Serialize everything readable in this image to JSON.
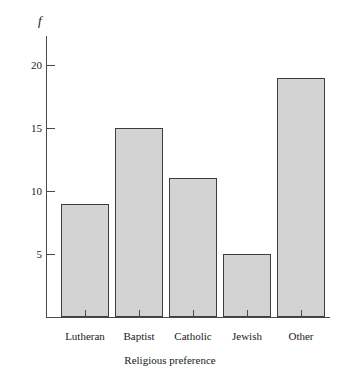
{
  "chart_data": {
    "type": "bar",
    "title": "",
    "subtitle": "",
    "xlabel": "Religious preference",
    "ylabel": "f",
    "categories": [
      "Lutheran",
      "Baptist",
      "Catholic",
      "Jewish",
      "Other"
    ],
    "values": [
      9,
      15,
      11,
      5,
      19
    ],
    "series": [
      {
        "name": "f",
        "values": [
          9,
          15,
          11,
          5,
          19
        ]
      }
    ],
    "ylim": [
      0,
      22
    ],
    "yticks": [
      5,
      10,
      15,
      20
    ],
    "ytick_labels": [
      "5",
      "10",
      "15",
      "20"
    ],
    "grid": false,
    "legend": false,
    "legend_position": "none",
    "bar_fill_color": "#d3d3d3",
    "bar_border_color": "#3d3d3d",
    "axis_color": "#4a4a4a",
    "background_color": "#ffffff"
  },
  "axes": {
    "y_axis_label": "f",
    "x_axis_label": "Religious preference",
    "y_tick_labels": [
      "20",
      "15",
      "10",
      "5"
    ]
  },
  "bars": [
    {
      "label": "Lutheran",
      "value": 9
    },
    {
      "label": "Baptist",
      "value": 15
    },
    {
      "label": "Catholic",
      "value": 11
    },
    {
      "label": "Jewish",
      "value": 5
    },
    {
      "label": "Other",
      "value": 19
    }
  ]
}
